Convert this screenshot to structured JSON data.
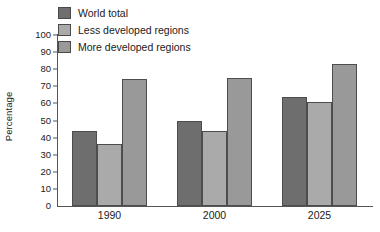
{
  "chart_data": {
    "type": "bar",
    "title": "",
    "subtitle": "",
    "xlabel": "",
    "ylabel": "Percentage",
    "categories": [
      "1990",
      "2000",
      "2025"
    ],
    "series": [
      {
        "name": "World total",
        "values": [
          44,
          50,
          64
        ],
        "color": "#6e6e6e"
      },
      {
        "name": "Less developed regions",
        "values": [
          36,
          44,
          61
        ],
        "color": "#aaaaaa"
      },
      {
        "name": "More developed regions",
        "values": [
          74,
          75,
          83
        ],
        "color": "#999999"
      }
    ],
    "ylim": [
      0,
      100
    ],
    "yticks": [
      0,
      10,
      20,
      30,
      40,
      50,
      60,
      70,
      80,
      90,
      100
    ],
    "ytick_labels": [
      "0",
      "10",
      "20",
      "30",
      "40",
      "50",
      "60",
      "70",
      "80",
      "90",
      "100"
    ],
    "grid": false,
    "legend_position": "top-left",
    "bar_border_color": "#4d4d4d",
    "axis_color": "#555555",
    "background": "#ffffff"
  },
  "legend": {
    "items": [
      {
        "label": "World total",
        "swatch": "legend-swatch-world-total"
      },
      {
        "label": "Less developed regions",
        "swatch": "legend-swatch-less-developed"
      },
      {
        "label": "More developed regions",
        "swatch": "legend-swatch-more-developed"
      }
    ]
  },
  "axes": {
    "y_title": "Percentage"
  }
}
